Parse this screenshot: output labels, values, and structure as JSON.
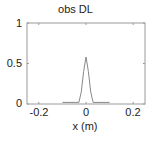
{
  "chart_data": {
    "type": "line",
    "title": "obs DL",
    "xlabel": "x (m)",
    "ylabel": "",
    "xlim": [
      -0.25,
      0.25
    ],
    "ylim": [
      0,
      1
    ],
    "xticks": [
      "-0.2",
      "0",
      "0.2"
    ],
    "yticks": [
      "0",
      "0.5",
      "1"
    ],
    "grid": false,
    "legend": null,
    "series": [
      {
        "name": "obs DL",
        "color": "#888888",
        "x": [
          -0.1,
          -0.03,
          -0.02,
          -0.01,
          0.0,
          0.01,
          0.02,
          0.03,
          0.1
        ],
        "y": [
          0.02,
          0.02,
          0.15,
          0.4,
          0.58,
          0.4,
          0.15,
          0.02,
          0.02
        ]
      }
    ]
  }
}
